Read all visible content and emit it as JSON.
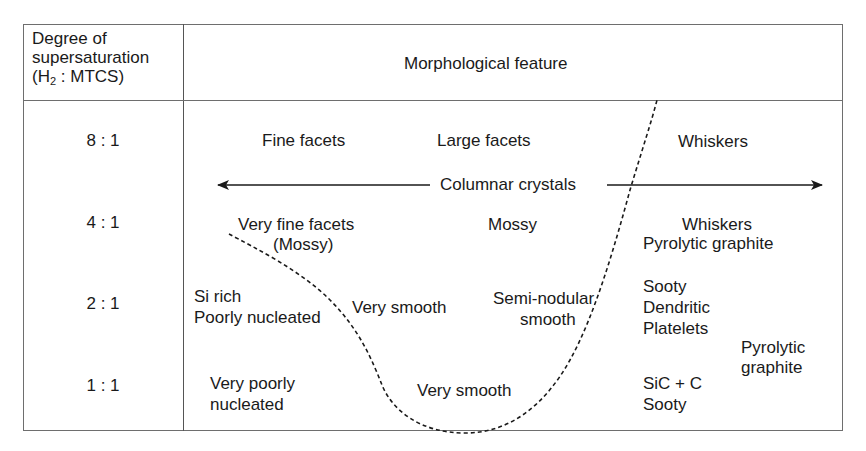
{
  "header": {
    "left_line1": "Degree of",
    "left_line2": "supersaturation",
    "left_line3_pre": "(H",
    "left_line3_sub": "2",
    "left_line3_post": " : MTCS)",
    "right": "Morphological feature"
  },
  "rows": [
    {
      "ratio": "8 : 1"
    },
    {
      "ratio": "4 : 1"
    },
    {
      "ratio": "2 : 1"
    },
    {
      "ratio": "1 : 1"
    }
  ],
  "features": {
    "fine_facets": "Fine facets",
    "large_facets": "Large facets",
    "whiskers_8": "Whiskers",
    "columnar_crystals": "Columnar crystals",
    "very_fine_facets": "Very fine facets",
    "mossy_paren": "(Mossy)",
    "mossy": "Mossy",
    "whiskers_4": "Whiskers",
    "pyrolytic_graphite_4": "Pyrolytic graphite",
    "si_rich": "Si rich",
    "poorly_nucleated": "Poorly nucleated",
    "very_smooth_2": "Very smooth",
    "semi_nodular": "Semi-nodular",
    "smooth": "smooth",
    "sooty_2": "Sooty",
    "dendritic": "Dendritic",
    "platelets": "Platelets",
    "pyrolytic": "Pyrolytic",
    "graphite": "graphite",
    "very_poorly": "Very poorly",
    "nucleated": "nucleated",
    "very_smooth_1": "Very smooth",
    "sic_c": "SiC + C",
    "sooty_1": "Sooty"
  },
  "colors": {
    "line": "#1a1a1a",
    "border": "#6e6e6e"
  }
}
